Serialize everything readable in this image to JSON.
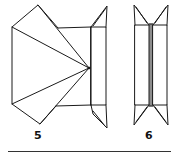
{
  "figures": [
    {
      "id": "step-5",
      "label": "5"
    },
    {
      "id": "step-6",
      "label": "6"
    }
  ],
  "colors": {
    "line": "#1a1a1a",
    "background": "#ffffff"
  }
}
